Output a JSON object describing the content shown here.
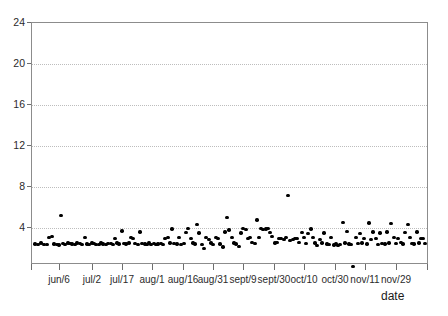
{
  "chart_data": {
    "type": "scatter",
    "title": "",
    "subtitle": "",
    "xlabel": "date",
    "ylabel": "",
    "grid": true,
    "legend": null,
    "ylim": [
      0,
      24
    ],
    "yticks": [
      4,
      8,
      12,
      16,
      20,
      24
    ],
    "ytick_labels": [
      "4",
      "8",
      "12",
      "16",
      "20",
      "24"
    ],
    "xtick_labels": [
      "jun/6",
      "jul/2",
      "jul/17",
      "aug/1",
      "aug/16",
      "aug/31",
      "sept/9",
      "sept/30",
      "oct/10",
      "oct/30",
      "nov/11",
      "nov/29"
    ],
    "xtick_positions_px": [
      59,
      92,
      122,
      152,
      183,
      213,
      243,
      274,
      304,
      335,
      365,
      396
    ],
    "series": [
      {
        "name": "daily value",
        "marker": "filled-circle",
        "color": "#000000",
        "points": [
          [
            34,
            2.45
          ],
          [
            37,
            2.4
          ],
          [
            40,
            2.55
          ],
          [
            43,
            2.38
          ],
          [
            46,
            2.42
          ],
          [
            48,
            3.1
          ],
          [
            51,
            3.15
          ],
          [
            53,
            2.45
          ],
          [
            56,
            2.4
          ],
          [
            58,
            2.35
          ],
          [
            60,
            5.2
          ],
          [
            62,
            2.5
          ],
          [
            64,
            2.42
          ],
          [
            67,
            2.55
          ],
          [
            69,
            2.5
          ],
          [
            71,
            2.45
          ],
          [
            74,
            2.4
          ],
          [
            76,
            2.52
          ],
          [
            79,
            2.48
          ],
          [
            81,
            2.4
          ],
          [
            84,
            3.05
          ],
          [
            86,
            2.45
          ],
          [
            88,
            2.42
          ],
          [
            91,
            2.55
          ],
          [
            93,
            2.48
          ],
          [
            95,
            2.42
          ],
          [
            98,
            2.4
          ],
          [
            100,
            2.52
          ],
          [
            102,
            2.45
          ],
          [
            105,
            2.38
          ],
          [
            107,
            2.5
          ],
          [
            110,
            2.48
          ],
          [
            112,
            2.42
          ],
          [
            114,
            3.0
          ],
          [
            116,
            2.55
          ],
          [
            118,
            2.45
          ],
          [
            121,
            3.7
          ],
          [
            123,
            2.5
          ],
          [
            125,
            2.45
          ],
          [
            128,
            2.55
          ],
          [
            130,
            3.05
          ],
          [
            132,
            2.95
          ],
          [
            134,
            2.48
          ],
          [
            137,
            2.42
          ],
          [
            139,
            3.6
          ],
          [
            141,
            2.5
          ],
          [
            144,
            2.45
          ],
          [
            146,
            2.4
          ],
          [
            148,
            2.55
          ],
          [
            150,
            2.42
          ],
          [
            153,
            2.48
          ],
          [
            155,
            2.4
          ],
          [
            157,
            2.45
          ],
          [
            160,
            2.5
          ],
          [
            162,
            2.42
          ],
          [
            164,
            3.0
          ],
          [
            167,
            3.05
          ],
          [
            169,
            2.55
          ],
          [
            171,
            3.9
          ],
          [
            173,
            2.5
          ],
          [
            176,
            2.45
          ],
          [
            178,
            3.1
          ],
          [
            180,
            2.4
          ],
          [
            183,
            2.48
          ],
          [
            185,
            3.55
          ],
          [
            187,
            3.95
          ],
          [
            190,
            3.0
          ],
          [
            192,
            2.55
          ],
          [
            194,
            2.45
          ],
          [
            196,
            4.35
          ],
          [
            198,
            3.5
          ],
          [
            201,
            2.42
          ],
          [
            203,
            2.0
          ],
          [
            205,
            3.05
          ],
          [
            208,
            2.9
          ],
          [
            210,
            2.55
          ],
          [
            212,
            2.42
          ],
          [
            215,
            3.1
          ],
          [
            217,
            3.0
          ],
          [
            219,
            2.45
          ],
          [
            222,
            2.15
          ],
          [
            224,
            3.6
          ],
          [
            226,
            5.05
          ],
          [
            228,
            3.8
          ],
          [
            231,
            3.05
          ],
          [
            233,
            2.55
          ],
          [
            235,
            2.45
          ],
          [
            238,
            2.2
          ],
          [
            240,
            3.5
          ],
          [
            242,
            3.95
          ],
          [
            245,
            3.85
          ],
          [
            247,
            2.95
          ],
          [
            249,
            3.05
          ],
          [
            251,
            2.6
          ],
          [
            254,
            2.5
          ],
          [
            256,
            4.8
          ],
          [
            258,
            3.05
          ],
          [
            260,
            3.95
          ],
          [
            262,
            3.85
          ],
          [
            265,
            3.9
          ],
          [
            267,
            3.95
          ],
          [
            269,
            3.55
          ],
          [
            271,
            3.15
          ],
          [
            274,
            2.55
          ],
          [
            276,
            2.6
          ],
          [
            278,
            3.0
          ],
          [
            280,
            2.95
          ],
          [
            283,
            2.9
          ],
          [
            285,
            3.05
          ],
          [
            287,
            7.2
          ],
          [
            289,
            2.8
          ],
          [
            292,
            2.85
          ],
          [
            294,
            2.95
          ],
          [
            296,
            3.0
          ],
          [
            298,
            2.6
          ],
          [
            301,
            3.55
          ],
          [
            303,
            3.05
          ],
          [
            305,
            2.5
          ],
          [
            307,
            3.45
          ],
          [
            310,
            3.9
          ],
          [
            312,
            3.1
          ],
          [
            314,
            2.55
          ],
          [
            316,
            2.3
          ],
          [
            319,
            2.9
          ],
          [
            321,
            2.55
          ],
          [
            323,
            3.5
          ],
          [
            326,
            2.45
          ],
          [
            328,
            2.4
          ],
          [
            330,
            3.05
          ],
          [
            333,
            2.35
          ],
          [
            335,
            2.45
          ],
          [
            337,
            2.3
          ],
          [
            339,
            2.4
          ],
          [
            342,
            4.55
          ],
          [
            344,
            2.55
          ],
          [
            346,
            3.65
          ],
          [
            348,
            2.45
          ],
          [
            350,
            2.4
          ],
          [
            352,
            0.25
          ],
          [
            355,
            3.05
          ],
          [
            357,
            2.5
          ],
          [
            359,
            3.45
          ],
          [
            361,
            2.55
          ],
          [
            363,
            3.0
          ],
          [
            366,
            2.45
          ],
          [
            368,
            4.5
          ],
          [
            370,
            2.9
          ],
          [
            372,
            3.6
          ],
          [
            375,
            3.0
          ],
          [
            377,
            2.4
          ],
          [
            379,
            3.5
          ],
          [
            381,
            2.5
          ],
          [
            384,
            2.45
          ],
          [
            386,
            3.6
          ],
          [
            388,
            2.55
          ],
          [
            390,
            4.45
          ],
          [
            393,
            3.05
          ],
          [
            395,
            2.5
          ],
          [
            397,
            3.0
          ],
          [
            400,
            2.6
          ],
          [
            402,
            2.45
          ],
          [
            404,
            3.55
          ],
          [
            407,
            4.35
          ],
          [
            409,
            3.05
          ],
          [
            411,
            2.5
          ],
          [
            413,
            2.45
          ],
          [
            416,
            3.6
          ],
          [
            418,
            2.55
          ],
          [
            420,
            2.95
          ],
          [
            422,
            3.0
          ],
          [
            424,
            2.5
          ]
        ]
      }
    ]
  }
}
